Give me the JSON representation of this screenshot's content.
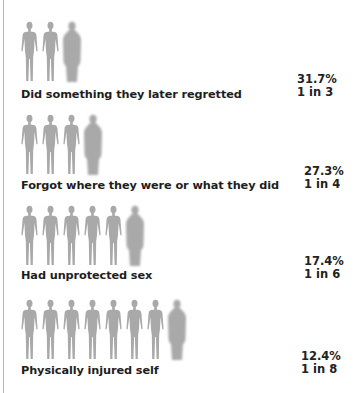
{
  "chart_data": {
    "type": "pictogram",
    "title": "",
    "units": "percent of respondents",
    "categories": [
      "Did something they later regretted",
      "Forgot where they were or what they did",
      "Had unprotected sex",
      "Physically injured self"
    ],
    "values": [
      31.7,
      27.3,
      17.4,
      12.4
    ],
    "ratios": [
      "1 in 3",
      "1 in 4",
      "1 in 6",
      "1 in 8"
    ],
    "figure_counts": [
      3,
      4,
      6,
      8
    ],
    "highlight": "last figure in each row rendered blurred/larger",
    "colors": {
      "figure": "#a9a9a9",
      "text": "#1d1d1d"
    }
  },
  "rows": [
    {
      "label": "Did something they later regretted",
      "percent": "31.7%",
      "ratio": "1 in 3",
      "count": 3
    },
    {
      "label": "Forgot where they were or what they did",
      "percent": "27.3%",
      "ratio": "1 in 4",
      "count": 4
    },
    {
      "label": "Had unprotected sex",
      "percent": "17.4%",
      "ratio": "1 in 6",
      "count": 6
    },
    {
      "label": "Physically injured self",
      "percent": "12.4%",
      "ratio": "1 in 8",
      "count": 8
    }
  ]
}
